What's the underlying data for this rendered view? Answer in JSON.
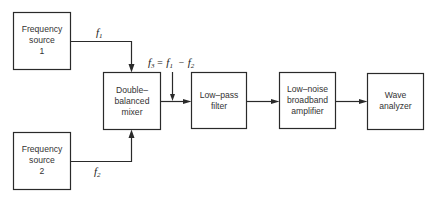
{
  "diagram": {
    "type": "block-diagram",
    "blocks": {
      "source1": {
        "lines": [
          "Frequency",
          "source",
          "1"
        ]
      },
      "source2": {
        "lines": [
          "Frequency",
          "source",
          "2"
        ]
      },
      "mixer": {
        "lines": [
          "Double–",
          "balanced",
          "mixer"
        ]
      },
      "lowpass": {
        "lines": [
          "Low–pass",
          "filter"
        ]
      },
      "amplifier": {
        "lines": [
          "Low–noise",
          "broadband",
          "amplifier"
        ]
      },
      "analyzer": {
        "lines": [
          "Wave",
          "analyzer"
        ]
      }
    },
    "signals": {
      "f1": {
        "base": "f",
        "sub": "1"
      },
      "f2": {
        "base": "f",
        "sub": "2"
      },
      "f3": {
        "base": "f",
        "sub": "3",
        "eq": "=",
        "minus": "−"
      }
    },
    "connections": [
      {
        "from": "source1",
        "to": "mixer",
        "label": "f1"
      },
      {
        "from": "source2",
        "to": "mixer",
        "label": "f2"
      },
      {
        "from": "mixer",
        "to": "lowpass",
        "label": "f3 = f1 − f2"
      },
      {
        "from": "lowpass",
        "to": "amplifier"
      },
      {
        "from": "amplifier",
        "to": "analyzer"
      }
    ]
  }
}
